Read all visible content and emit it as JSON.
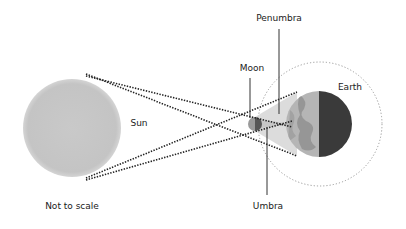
{
  "diagram": {
    "type": "lunar-eclipse-geometry",
    "labels": {
      "sun": "Sun",
      "moon": "Moon",
      "earth": "Earth",
      "penumbra": "Penumbra",
      "umbra": "Umbra",
      "note": "Not to scale"
    },
    "colors": {
      "background": "#ffffff",
      "sun": "#c8c8c8",
      "earth_light": "#b3b3b3",
      "earth_dark": "#3a3a3a",
      "moon": "#7a7a7a",
      "penumbra_cone": "#d6d6d6",
      "lines": "#222222",
      "orbit": "#9a9a9a"
    }
  }
}
